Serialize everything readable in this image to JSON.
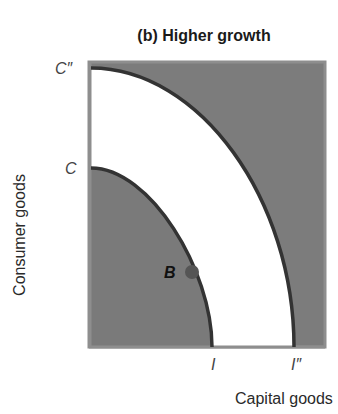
{
  "title": "(b) Higher growth",
  "axes": {
    "y_label": "Consumer goods",
    "x_label": "Capital goods",
    "y_ticks": [
      "C″",
      "C"
    ],
    "x_ticks": [
      "I",
      "I″"
    ]
  },
  "points": [
    {
      "label": "B",
      "description": "Point on original production possibilities frontier"
    }
  ],
  "curves": [
    {
      "name": "original-ppf",
      "from": "C",
      "to": "I"
    },
    {
      "name": "shifted-ppf",
      "from": "C″",
      "to": "I″"
    }
  ],
  "colors": {
    "frame": "#8a8a8a",
    "shaded": "#7a7a7a",
    "curve": "#333333",
    "point": "#555555",
    "background": "#ffffff"
  }
}
